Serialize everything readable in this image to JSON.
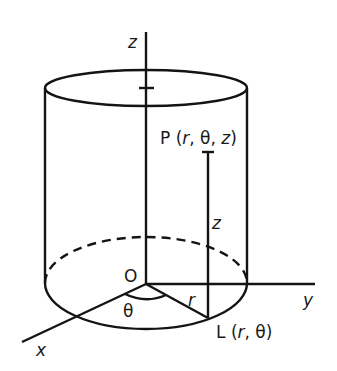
{
  "diagram": {
    "axes": {
      "z_label": "z",
      "y_label": "y",
      "x_label": "x"
    },
    "origin_label": "O",
    "point_P": {
      "prefix": "P (",
      "r": "r",
      "sep1": ", θ, ",
      "z": "z",
      "suffix": ")"
    },
    "point_L": {
      "prefix": "L (",
      "r": "r",
      "sep": ", θ)"
    },
    "height_label": "z",
    "radius_label": "r",
    "angle_label": "θ",
    "colors": {
      "stroke": "#141414",
      "background": "#ffffff"
    }
  }
}
